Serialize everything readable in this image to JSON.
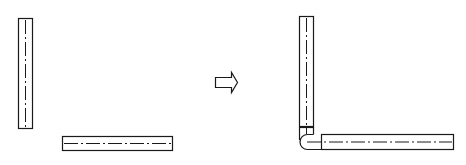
{
  "diagram": {
    "colors": {
      "line": "#1a1a1a",
      "background": "#ffffff"
    },
    "before": {
      "vertical_bar": {
        "x": 18,
        "y": 18,
        "width": 14,
        "height": 110
      },
      "horizontal_bar": {
        "x": 62,
        "y": 136,
        "width": 110,
        "height": 14
      }
    },
    "transition": {
      "icon": "hollow-right-arrow"
    },
    "after": {
      "vertical_bar": {
        "x": 299,
        "y": 16,
        "width": 14,
        "height": 111
      },
      "joint_band": {
        "y": 126
      },
      "horizontal_bar": {
        "x": 321,
        "y": 134,
        "width": 132,
        "height": 14
      },
      "elbow": "rounded-corner"
    }
  }
}
